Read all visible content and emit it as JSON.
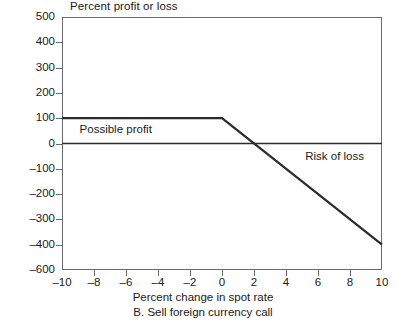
{
  "chart_data": {
    "type": "line",
    "title": "",
    "ylabel": "Percent profit or loss",
    "xlabel": "Percent change in spot rate",
    "caption": "B. Sell foreign currency call",
    "xlim": [
      -10,
      10
    ],
    "ylim": [
      -600,
      500
    ],
    "grid": false,
    "legend_position": "none",
    "xticks": [
      -10,
      -8,
      -6,
      -4,
      -2,
      0,
      2,
      4,
      6,
      8,
      10
    ],
    "xticklabels": [
      "–10",
      "–8",
      "–6",
      "–4",
      "–2",
      "0",
      "2",
      "4",
      "6",
      "8",
      "10"
    ],
    "yticks": [
      500,
      400,
      300,
      200,
      100,
      0,
      -100,
      -200,
      -300,
      -400,
      -600
    ],
    "yticklabels": [
      "500",
      "400",
      "300",
      "200",
      "100",
      "0",
      "–100",
      "–200",
      "–300",
      "–400",
      "–600"
    ],
    "series": [
      {
        "name": "Sell foreign currency call payoff",
        "x": [
          -10,
          0,
          10
        ],
        "values": [
          100,
          100,
          -400
        ]
      },
      {
        "name": "Zero profit reference line",
        "x": [
          -10,
          10
        ],
        "values": [
          0,
          0
        ]
      }
    ],
    "annotations": [
      {
        "text": "Possible profit",
        "x": -8.9,
        "y": 55
      },
      {
        "text": "Risk of loss",
        "x": 5.2,
        "y": -55
      }
    ],
    "breakeven_x": 2
  },
  "style": {
    "line_color": "#2b2b2b",
    "axis_color": "#6b6b6b",
    "text_color": "#1a1a1a",
    "background": "#ffffff"
  }
}
